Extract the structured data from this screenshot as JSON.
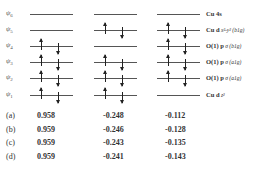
{
  "diagram": {
    "levels": [
      {
        "psi": "ψ",
        "sub": "6",
        "y": 14,
        "label_main": "Cu 4s",
        "label_sub": "",
        "occupancy": [
          false,
          false,
          false
        ]
      },
      {
        "psi": "ψ",
        "sub": "5",
        "y": 30,
        "label_main": "Cu d",
        "label_sub": "x²-y² (b1g)",
        "occupancy": [
          false,
          true,
          true
        ]
      },
      {
        "psi": "ψ",
        "sub": "4",
        "y": 46,
        "label_main": "O(1) p",
        "label_sub": "σ (b1g)",
        "occupancy": [
          true,
          false,
          true
        ]
      },
      {
        "psi": "ψ",
        "sub": "3",
        "y": 62,
        "label_main": "O(1) p",
        "label_sub": "σ (a1g)",
        "occupancy": [
          true,
          true,
          true
        ]
      },
      {
        "psi": "ψ",
        "sub": "2",
        "y": 78,
        "label_main": "O(1) p",
        "label_sub": "σ (a1g)",
        "occupancy": [
          true,
          true,
          true
        ]
      },
      {
        "psi": "ψ",
        "sub": "1",
        "y": 95,
        "label_main": "Cu d",
        "label_sub": "z²",
        "occupancy": [
          true,
          true,
          false
        ]
      }
    ],
    "columns_x": [
      30,
      94,
      157
    ],
    "column_width": 43
  },
  "table": {
    "rows": [
      {
        "label": "(a)",
        "values": [
          "0.958",
          "-0.248",
          "-0.112"
        ]
      },
      {
        "label": "(b)",
        "values": [
          "0.959",
          "-0.246",
          "-0.128"
        ]
      },
      {
        "label": "(c)",
        "values": [
          "0.959",
          "-0.243",
          "-0.135"
        ]
      },
      {
        "label": "(d)",
        "values": [
          "0.959",
          "-0.241",
          "-0.143"
        ]
      }
    ]
  }
}
